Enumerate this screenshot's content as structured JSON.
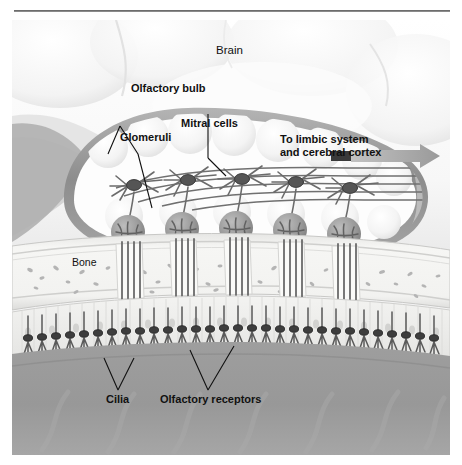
{
  "figure": {
    "type": "anatomical-diagram"
  },
  "labels": {
    "brain": "Brain",
    "olfactory_bulb": "Olfactory bulb",
    "glomeruli": "Glomeruli",
    "mitral_cells": "Mitral cells",
    "limbic_line1": "To limbic system",
    "limbic_line2": "and cerebral cortex",
    "bone": "Bone",
    "cilia": "Cilia",
    "olfactory_receptors": "Olfactory receptors"
  },
  "colors": {
    "brain_fill": "#fbfbfb",
    "bulb_rim": "#9a9a9a",
    "bulb_fill": "#fdfdfd",
    "glomerulus": "#9b9b9b",
    "neuron_stroke": "#6b6b6b",
    "bone_fill": "#f0f0ee",
    "bone_speck": "#b6b6b6",
    "mucosa": "#8e8e8e",
    "nasal_cavity": "#9d9d9d",
    "label_text": "#111111",
    "rule": "#5e5e5e",
    "arrow": "#8f8f8f",
    "arrow_tail": "#3a3a3a"
  },
  "structures": {
    "glomeruli_count": 5,
    "mitral_cells_count": 5,
    "axon_bundles": 5,
    "receptor_cells_count": 40,
    "layers": [
      "Brain",
      "Olfactory bulb",
      "Bone (cribriform plate)",
      "Olfactory epithelium",
      "Nasal cavity"
    ]
  }
}
